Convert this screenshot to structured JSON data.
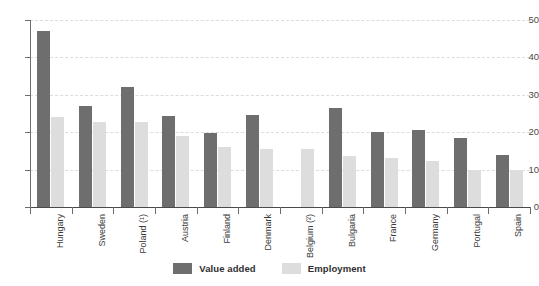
{
  "chart_data": {
    "type": "bar",
    "title": "",
    "subtitle": "",
    "xlabel": "",
    "ylabel": "",
    "ylim": [
      0,
      50
    ],
    "yticks": [
      0,
      10,
      20,
      30,
      40,
      50
    ],
    "grid": true,
    "legend_position": "bottom",
    "categories": [
      "Hungary",
      "Sweden",
      "Poland (¹)",
      "Austria",
      "Finland",
      "Denmark",
      "Belgium (²)",
      "Bulgaria",
      "France",
      "Germany",
      "Portugal",
      "Spain"
    ],
    "series": [
      {
        "name": "Value added",
        "color": "#6e6e6e",
        "values": [
          47.0,
          27.0,
          32.2,
          24.4,
          19.8,
          24.7,
          null,
          26.6,
          20.0,
          20.6,
          18.4,
          14.0
        ]
      },
      {
        "name": "Employment",
        "color": "#dddddd",
        "values": [
          24.0,
          22.8,
          22.6,
          19.0,
          16.0,
          15.5,
          15.5,
          13.6,
          13.0,
          12.4,
          9.8,
          9.8
        ]
      }
    ]
  },
  "legend": {
    "items": [
      {
        "label": "Value added",
        "key": "value-added"
      },
      {
        "label": "Employment",
        "key": "employment"
      }
    ]
  }
}
